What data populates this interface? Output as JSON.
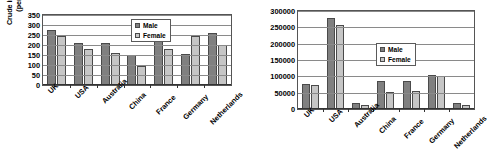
{
  "figure": {
    "background": "#ffffff",
    "male_color": "#808080",
    "female_color": "#c6c6c6"
  },
  "chart_data": [
    {
      "id": "left",
      "type": "bar",
      "title": "",
      "xlabel": "",
      "ylabel": "Crude incidence rate (per 100,000)",
      "ylabel_line1": "Crude incidence rate",
      "ylabel_line2": "(per 100,000)",
      "ylim": [
        0,
        350
      ],
      "yticks": [
        0,
        50,
        100,
        150,
        200,
        250,
        300,
        350
      ],
      "ytick_labels": [
        "0",
        "50",
        "100",
        "150",
        "200",
        "250",
        "300",
        "350"
      ],
      "grid": true,
      "legend_position": "upper right inside",
      "categories": [
        "UK",
        "USA",
        "Australia",
        "China",
        "France",
        "Germany",
        "Netherlands"
      ],
      "series": [
        {
          "name": "Male",
          "values": [
            275,
            210,
            210,
            148,
            300,
            155,
            258
          ]
        },
        {
          "name": "Female",
          "values": [
            245,
            182,
            158,
            95,
            178,
            243,
            202
          ]
        }
      ]
    },
    {
      "id": "right",
      "type": "bar",
      "title": "",
      "xlabel": "",
      "ylabel": "",
      "ylim": [
        0,
        300000
      ],
      "yticks": [
        0,
        50000,
        100000,
        150000,
        200000,
        250000,
        300000
      ],
      "ytick_labels": [
        "0",
        "50000",
        "100000",
        "150000",
        "200000",
        "250000",
        "300000"
      ],
      "grid": true,
      "legend_position": "upper center inside",
      "categories": [
        "UK",
        "USA",
        "Australia",
        "China",
        "France",
        "Germany",
        "Netherlands"
      ],
      "series": [
        {
          "name": "Male",
          "values": [
            78000,
            280000,
            19000,
            85000,
            85000,
            105000,
            18000
          ]
        },
        {
          "name": "Female",
          "values": [
            73000,
            258000,
            13000,
            51000,
            54000,
            101000,
            13000
          ]
        }
      ]
    }
  ]
}
